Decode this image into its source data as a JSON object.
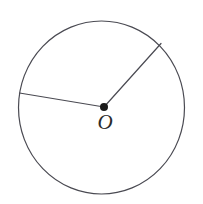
{
  "figure": {
    "kind": "geometry-diagram",
    "background_color": "#ffffff",
    "stroke_color": "#4a4a52",
    "point_color": "#1a1a1a",
    "label_color": "#2b2b2b",
    "stroke_width": 1.2
  },
  "labels": {
    "center": "O"
  },
  "chart_data": {
    "type": "scatter",
    "xlabel": "",
    "ylabel": "",
    "xlim": [
      0,
      203
    ],
    "ylim": [
      204,
      0
    ],
    "grid": false,
    "legend": "none",
    "shapes": [
      {
        "name": "circle",
        "type": "ellipse",
        "cx": 101.5,
        "cy": 107.5,
        "rx": 83.0,
        "ry": 86.5,
        "stroke": "#4a4a52",
        "fill": "none"
      },
      {
        "name": "radius-upper-right",
        "type": "line",
        "x1": 104.0,
        "y1": 107.0,
        "x2": 161.0,
        "y2": 43.5,
        "stroke": "#4a4a52"
      },
      {
        "name": "radius-left",
        "type": "line",
        "x1": 104.0,
        "y1": 107.0,
        "x2": 19.5,
        "y2": 93.0,
        "stroke": "#4a4a52"
      },
      {
        "name": "center-point",
        "type": "point",
        "cx": 104.0,
        "cy": 107.0,
        "r": 4.0,
        "fill": "#1a1a1a"
      }
    ],
    "annotations": [
      {
        "name": "center-label",
        "text": "O",
        "x": 105.5,
        "y": 128.0
      }
    ]
  }
}
